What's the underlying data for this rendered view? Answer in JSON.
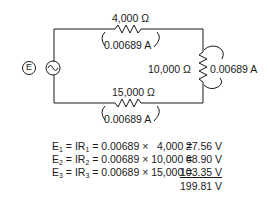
{
  "circuit": {
    "source_label": "E",
    "source_symbol": "~",
    "resistors": [
      {
        "position": "top",
        "resistance": "4,000 Ω",
        "current": "0.00689 A"
      },
      {
        "position": "right",
        "resistance": "10,000 Ω",
        "current": "0.00689 A"
      },
      {
        "position": "bottom",
        "resistance": "15,000 Ω",
        "current": "0.00689 A"
      }
    ]
  },
  "equations": [
    {
      "e": "E",
      "sub": "1",
      "mid": " = IR",
      "rsub": "1",
      "expr": " = 0.00689 ×   4,000 =",
      "result": "27.56 V"
    },
    {
      "e": "E",
      "sub": "2",
      "mid": " = IR",
      "rsub": "2",
      "expr": " = 0.00689 × 10,000 =",
      "result": "68.90 V"
    },
    {
      "e": "E",
      "sub": "3",
      "mid": " = IR",
      "rsub": "3",
      "expr": " = 0.00689 × 15,000 =",
      "result": "103.35 V"
    }
  ],
  "total": "199.81 V"
}
